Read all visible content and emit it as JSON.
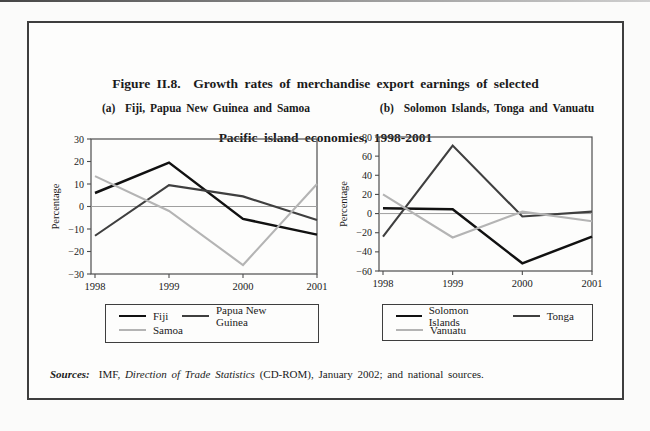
{
  "figure": {
    "title_line1": "Figure II.8.  Growth rates of merchandise export earnings of selected",
    "title_line2": "Pacific island economies, 1998-2001"
  },
  "panels": [
    {
      "title": "(a)  Fiji, Papua New Guinea and Samoa"
    },
    {
      "title": "(b)  Solomon Islands, Tonga and Vanuatu"
    }
  ],
  "chart_data": [
    {
      "type": "line",
      "title": "(a) Fiji, Papua New Guinea and Samoa",
      "categories": [
        "1998",
        "1999",
        "2000",
        "2001"
      ],
      "series": [
        {
          "name": "Fiji",
          "color": "#111111",
          "values": [
            6,
            19.5,
            -5.5,
            -12.5
          ]
        },
        {
          "name": "Papua New Guinea",
          "color": "#3f3f3f",
          "values": [
            -13,
            9.5,
            4.5,
            -6
          ]
        },
        {
          "name": "Samoa",
          "color": "#b4b4b4",
          "values": [
            13.5,
            -2,
            -26,
            10
          ]
        }
      ],
      "xlabel": "",
      "ylabel": "Percentage",
      "ylim": [
        -30,
        30
      ],
      "ytick_step": 10,
      "grid": false,
      "zero_line": true,
      "legend_position": "below",
      "legend_rows": [
        [
          0,
          1
        ],
        [
          2
        ]
      ]
    },
    {
      "type": "line",
      "title": "(b) Solomon Islands, Tonga and Vanuatu",
      "categories": [
        "1998",
        "1999",
        "2000",
        "2001"
      ],
      "series": [
        {
          "name": "Solomon Islands",
          "color": "#111111",
          "values": [
            5.5,
            4.5,
            -52,
            -24
          ]
        },
        {
          "name": "Tonga",
          "color": "#3f3f3f",
          "values": [
            -24,
            71,
            -3,
            2
          ]
        },
        {
          "name": "Vanuatu",
          "color": "#b4b4b4",
          "values": [
            20,
            -25,
            2,
            -8
          ]
        }
      ],
      "xlabel": "",
      "ylabel": "Percentage",
      "ylim": [
        -60,
        80
      ],
      "ytick_step": 20,
      "grid": false,
      "zero_line": true,
      "legend_position": "below",
      "legend_rows": [
        [
          0,
          1
        ],
        [
          2
        ]
      ]
    }
  ],
  "sources": {
    "label": "Sources:",
    "pre": "IMF, ",
    "italic": "Direction of Trade Statistics",
    "post": " (CD-ROM), January 2002; and national sources."
  },
  "colors": {
    "line_dark": "#111111",
    "line_mid": "#3f3f3f",
    "line_light": "#b4b4b4",
    "frame": "#3e3e3e"
  }
}
